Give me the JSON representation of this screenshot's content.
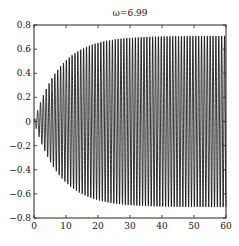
{
  "chart_data": {
    "type": "line",
    "title": "ω=6.99",
    "xlabel": "",
    "ylabel": "",
    "xlim": [
      0,
      60
    ],
    "ylim": [
      -0.8,
      0.8
    ],
    "x_ticks": [
      0,
      10,
      20,
      30,
      40,
      50,
      60
    ],
    "y_ticks": [
      -0.8,
      -0.6,
      -0.4,
      -0.2,
      0,
      0.2,
      0.4,
      0.6,
      0.8
    ],
    "x_tick_labels": [
      "0",
      "10",
      "20",
      "30",
      "40",
      "50",
      "60"
    ],
    "y_tick_labels": [
      "−0.8",
      "−0.6",
      "−0.4",
      "−0.2",
      "0",
      "0.2",
      "0.4",
      "0.6",
      "0.8"
    ],
    "grid": false,
    "legend": null,
    "series": [
      {
        "name": "response",
        "description": "Oscillation at ω=6.99 with growing envelope saturating near ±0.71",
        "omega": 6.99,
        "envelope": {
          "form": "A(1 - exp(-t/tau))",
          "A": 0.71,
          "tau": 8
        },
        "envelope_samples": {
          "x": [
            0,
            5,
            10,
            15,
            20,
            25,
            30,
            40,
            50,
            60
          ],
          "amplitude": [
            0.0,
            0.33,
            0.51,
            0.61,
            0.65,
            0.68,
            0.7,
            0.71,
            0.71,
            0.71
          ]
        },
        "color": "#000000"
      }
    ]
  }
}
